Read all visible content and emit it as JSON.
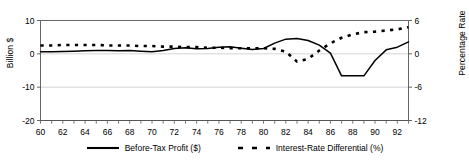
{
  "chart_data": {
    "type": "line",
    "title": "",
    "xlabel": "",
    "ylabel": "Billion $",
    "ylabel_right": "Percentage Rate",
    "grid": true,
    "legend_position": "bottom",
    "x": [
      60,
      61,
      62,
      63,
      64,
      65,
      66,
      67,
      68,
      69,
      70,
      71,
      72,
      73,
      74,
      75,
      76,
      77,
      78,
      79,
      80,
      81,
      82,
      83,
      84,
      85,
      86,
      87,
      88,
      89,
      90,
      91,
      92,
      93
    ],
    "xticklabels": [
      "60",
      "62",
      "64",
      "66",
      "68",
      "70",
      "72",
      "74",
      "76",
      "78",
      "80",
      "82",
      "84",
      "86",
      "88",
      "90",
      "92"
    ],
    "xtickvalues": [
      60,
      62,
      64,
      66,
      68,
      70,
      72,
      74,
      76,
      78,
      80,
      82,
      84,
      86,
      88,
      90,
      92
    ],
    "xlim": [
      60,
      93
    ],
    "ylim": [
      -20,
      10
    ],
    "yticks": [
      10,
      0,
      -10,
      -20
    ],
    "yticklabels": [
      "10",
      "0",
      "-10",
      "-20"
    ],
    "ylim_right": [
      -12,
      6
    ],
    "yticks_right": [
      6,
      0,
      -6,
      -12
    ],
    "yticklabels_right": [
      "6",
      "0",
      "-6",
      "-12"
    ],
    "series": [
      {
        "name": "Before-Tax Profit ($)",
        "axis": "left",
        "style": "solid",
        "color": "#000000",
        "values": [
          0.6,
          0.6,
          0.7,
          0.8,
          0.9,
          1.0,
          1.0,
          0.9,
          1.0,
          0.8,
          0.6,
          1.0,
          1.6,
          1.8,
          1.5,
          1.6,
          2.0,
          2.1,
          1.7,
          1.3,
          1.6,
          3.2,
          4.4,
          4.6,
          4.0,
          2.6,
          0.2,
          -6.6,
          -6.6,
          -6.6,
          -2.0,
          1.2,
          2.0,
          3.6
        ]
      },
      {
        "name": "Interest-Rate Differential (%)",
        "axis": "right",
        "style": "dashed",
        "color": "#000000",
        "values": [
          1.5,
          1.5,
          1.6,
          1.6,
          1.6,
          1.6,
          1.5,
          1.5,
          1.5,
          1.4,
          1.4,
          1.3,
          1.3,
          1.2,
          1.2,
          1.1,
          1.1,
          1.0,
          1.0,
          1.0,
          1.0,
          0.9,
          0.4,
          -1.4,
          -0.9,
          0.6,
          1.9,
          2.9,
          3.5,
          3.9,
          4.0,
          4.2,
          4.4,
          4.8
        ]
      }
    ]
  },
  "legend": {
    "items": [
      {
        "label": "Before-Tax Profit ($)",
        "style": "solid"
      },
      {
        "label": "Interest-Rate Differential (%)",
        "style": "dashed"
      }
    ]
  },
  "colors": {
    "line": "#000000",
    "grid": "#c9c9c9",
    "axis": "#555555",
    "background": "#ffffff"
  }
}
